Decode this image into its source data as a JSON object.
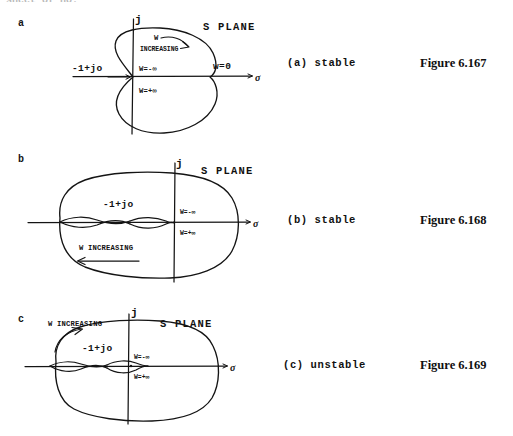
{
  "page": {
    "cropped_header_text": "sheet of no.",
    "background": "#ffffff",
    "ink_color": "#141414"
  },
  "panels": [
    {
      "letter": "a",
      "s_plane_label": "S PLANE",
      "caption": "(a) stable",
      "figure_label": "Figure 6.167",
      "axis_imag_label": "j",
      "axis_real_label": "σ",
      "annotations": {
        "critical_point": "-1+jo",
        "w_increasing_line1": "W",
        "w_increasing_line2": "INCREASING",
        "w_minus_inf": "W=-∞",
        "w_plus_inf": "W=+∞",
        "w_zero": "w=0"
      }
    },
    {
      "letter": "b",
      "s_plane_label": "S PLANE",
      "caption": "(b) stable",
      "figure_label": "Figure 6.168",
      "axis_imag_label": "j",
      "axis_real_label": "σ",
      "annotations": {
        "critical_point": "-1+jo",
        "w_increasing": "W INCREASING",
        "w_minus_inf": "W=-∞",
        "w_plus_inf": "W=+∞"
      }
    },
    {
      "letter": "c",
      "s_plane_label": "S PLANE",
      "caption": "(c) unstable",
      "figure_label": "Figure 6.169",
      "axis_imag_label": "j",
      "axis_real_label": "σ",
      "annotations": {
        "critical_point": "-1+jo",
        "w_increasing": "W INCREASING",
        "w_minus_inf": "W=-∞",
        "w_plus_inf": "W=+∞"
      }
    }
  ]
}
